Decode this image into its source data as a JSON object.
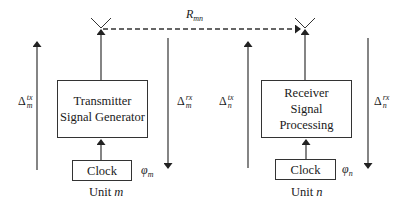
{
  "diagram": {
    "link_label": {
      "base": "R",
      "sub": "mn"
    },
    "units": [
      {
        "id": "m",
        "caption_prefix": "Unit",
        "caption_var": "m",
        "main_block": {
          "line1": "Transmitter",
          "line2": "Signal Generator"
        },
        "clock_block": {
          "label": "Clock"
        },
        "phase_label": {
          "base": "φ",
          "sub": "m"
        },
        "delay_tx": {
          "base": "Δ",
          "sup": "tx",
          "sub": "m",
          "direction": "up"
        },
        "delay_rx": {
          "base": "Δ",
          "sup": "rx",
          "sub": "m",
          "direction": "down"
        },
        "antenna": "antenna-icon"
      },
      {
        "id": "n",
        "caption_prefix": "Unit",
        "caption_var": "n",
        "main_block": {
          "line1": "Receiver",
          "line2": "Signal Processing"
        },
        "clock_block": {
          "label": "Clock"
        },
        "phase_label": {
          "base": "φ",
          "sub": "n"
        },
        "delay_tx": {
          "base": "Δ",
          "sup": "tx",
          "sub": "n",
          "direction": "up"
        },
        "delay_rx": {
          "base": "Δ",
          "sup": "rx",
          "sub": "n",
          "direction": "down"
        },
        "antenna": "antenna-icon"
      }
    ],
    "colors": {
      "line": "#333333",
      "text": "#1a1a1a",
      "background": "#ffffff"
    }
  }
}
